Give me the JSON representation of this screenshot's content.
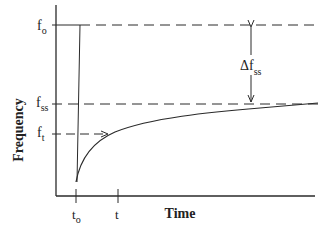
{
  "diagram": {
    "type": "frequency-time response",
    "axes": {
      "ylabel": "Frequency",
      "xlabel": "Time"
    },
    "y_levels": {
      "f0": {
        "base": "f",
        "sub": "o"
      },
      "fss": {
        "base": "f",
        "sub": "ss"
      },
      "ft": {
        "base": "f",
        "sub": "t"
      }
    },
    "x_ticks": {
      "t0": {
        "base": "t",
        "sub": "o"
      },
      "t": {
        "base": "t",
        "sub": ""
      }
    },
    "annotation": {
      "delta": "Δf",
      "sub": "ss"
    },
    "colors": {
      "line": "#2a2a2a",
      "background": "#ffffff"
    }
  }
}
